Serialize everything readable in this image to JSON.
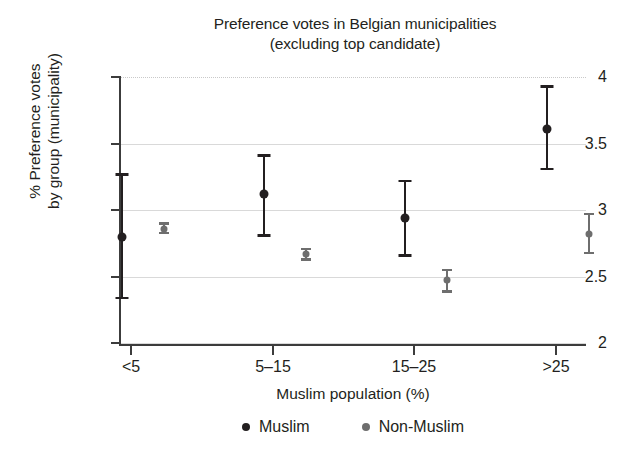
{
  "chart_data": {
    "type": "scatter",
    "title": "Preference votes in Belgian municipalities (excluding top candidate)",
    "title_lines": [
      "Preference votes in Belgian municipalities",
      "(excluding top candidate)"
    ],
    "xlabel": "Muslim population (%)",
    "ylabel": "% Preference votes by group (municipality)",
    "ylabel_lines": [
      "% Preference votes",
      "by group (municipality)"
    ],
    "categories": [
      "<5",
      "5–15",
      "15–25",
      ">25"
    ],
    "ylim": [
      2,
      4
    ],
    "yticks": [
      4,
      3.5,
      3,
      2.5,
      2
    ],
    "ytick_labels": [
      "4",
      "3.5",
      "3",
      "2.5",
      "2"
    ],
    "grid": "horizontal",
    "legend_position": "bottom",
    "series": [
      {
        "name": "Muslim",
        "color": "#231f20",
        "marker": "circle",
        "marker_size": 9,
        "values": [
          2.8,
          3.12,
          2.94,
          3.61
        ],
        "ci_low": [
          2.34,
          2.81,
          2.66,
          3.31
        ],
        "ci_high": [
          3.27,
          3.41,
          3.22,
          3.93
        ]
      },
      {
        "name": "Non-Muslim",
        "color": "#6e6e6e",
        "marker": "circle",
        "marker_size": 7,
        "values": [
          2.86,
          2.67,
          2.47,
          2.82
        ],
        "ci_low": [
          2.83,
          2.63,
          2.39,
          2.68
        ],
        "ci_high": [
          2.9,
          2.71,
          2.55,
          2.97
        ]
      }
    ]
  },
  "legend": {
    "items": [
      {
        "label": "Muslim",
        "color": "#231f20"
      },
      {
        "label": "Non-Muslim",
        "color": "#6e6e6e"
      }
    ]
  }
}
